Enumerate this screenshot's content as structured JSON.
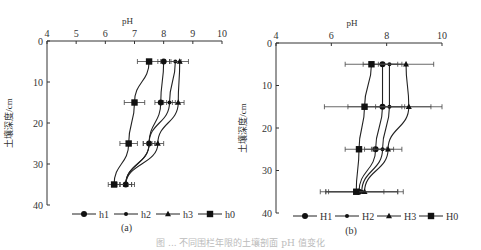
{
  "figure": {
    "caption": "图 ... 不同围栏年限的土壤剖面 pH 值变化",
    "panels": [
      "(a)",
      "(b)"
    ]
  },
  "chart_data": [
    {
      "type": "line",
      "panel_label": "(a)",
      "title": "",
      "xlabel": "pH",
      "ylabel": "土壤深度/cm",
      "xlim": [
        4,
        10
      ],
      "ylim": [
        40,
        0
      ],
      "x_ticks": [
        4,
        5,
        6,
        7,
        8,
        9,
        10
      ],
      "y_ticks": [
        0,
        10,
        20,
        30,
        40
      ],
      "x_axis_position": "top",
      "grid": false,
      "legend_position": "bottom",
      "depths": [
        5,
        15,
        25,
        35
      ],
      "series": [
        {
          "name": "h1",
          "marker": "circle",
          "values": [
            8.0,
            7.9,
            7.5,
            6.7
          ],
          "error": [
            0.2,
            0.2,
            0.2,
            0.2
          ]
        },
        {
          "name": "h2",
          "marker": "diamond",
          "values": [
            8.4,
            8.2,
            7.5,
            6.7
          ],
          "error": [
            0.2,
            0.2,
            0.2,
            0.2
          ]
        },
        {
          "name": "h3",
          "marker": "triangle",
          "values": [
            8.55,
            8.5,
            7.8,
            6.7
          ],
          "error": [
            0.3,
            0.2,
            0.2,
            0.3
          ]
        },
        {
          "name": "h0",
          "marker": "square",
          "values": [
            7.5,
            7.0,
            6.8,
            6.3
          ],
          "error": [
            0.4,
            0.35,
            0.3,
            0.2
          ]
        }
      ]
    },
    {
      "type": "line",
      "panel_label": "(b)",
      "title": "",
      "xlabel": "pH",
      "ylabel": "土壤深度/cm",
      "xlim": [
        4,
        10
      ],
      "ylim": [
        40,
        0
      ],
      "x_ticks": [
        4,
        6,
        8,
        10
      ],
      "y_ticks": [
        0,
        10,
        20,
        30,
        40
      ],
      "x_axis_position": "top",
      "grid": false,
      "legend_position": "bottom",
      "depths": [
        5,
        15,
        25,
        35
      ],
      "series": [
        {
          "name": "H1",
          "marker": "circle",
          "values": [
            7.85,
            7.85,
            7.6,
            7.0
          ],
          "error": [
            0.7,
            0.7,
            0.4,
            1.4
          ]
        },
        {
          "name": "H2",
          "marker": "diamond",
          "values": [
            8.1,
            8.1,
            7.85,
            7.1
          ],
          "error": [
            0.6,
            1.5,
            0.4,
            1.3
          ]
        },
        {
          "name": "H3",
          "marker": "triangle",
          "values": [
            8.7,
            8.8,
            8.05,
            7.2
          ],
          "error": [
            1.0,
            1.2,
            0.5,
            1.4
          ]
        },
        {
          "name": "H0",
          "marker": "square",
          "values": [
            7.45,
            7.2,
            7.0,
            6.9
          ],
          "error": [
            0.95,
            1.45,
            0.5,
            1.0
          ]
        }
      ]
    }
  ]
}
